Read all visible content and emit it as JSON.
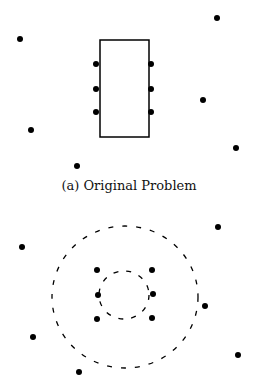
{
  "caption": "(a)  Original Problem",
  "colors": {
    "ink": "#000000",
    "background": "#ffffff"
  },
  "top_diagram": {
    "rectangle": {
      "x": 100,
      "y": 40,
      "width": 49,
      "height": 97
    },
    "attached_points": [
      [
        96,
        64
      ],
      [
        96,
        89
      ],
      [
        96,
        112
      ],
      [
        151,
        64
      ],
      [
        151,
        89
      ],
      [
        151,
        112
      ]
    ],
    "free_points": [
      [
        20,
        39
      ],
      [
        217,
        18
      ],
      [
        203,
        100
      ],
      [
        31,
        130
      ],
      [
        236,
        148
      ],
      [
        77,
        166
      ]
    ]
  },
  "bottom_diagram": {
    "outer_circle": {
      "cx": 125,
      "cy": 297,
      "rx": 73,
      "ry": 71,
      "style": "dashed"
    },
    "inner_circle": {
      "cx": 124,
      "cy": 295,
      "rx": 25,
      "ry": 24,
      "style": "dashed"
    },
    "inner_points": [
      [
        97,
        270
      ],
      [
        152,
        270
      ],
      [
        98,
        295
      ],
      [
        153,
        294
      ],
      [
        97,
        319
      ],
      [
        152,
        318
      ]
    ],
    "free_points": [
      [
        22,
        247
      ],
      [
        218,
        227
      ],
      [
        205,
        306
      ],
      [
        33,
        337
      ],
      [
        238,
        355
      ],
      [
        79,
        372
      ]
    ]
  }
}
